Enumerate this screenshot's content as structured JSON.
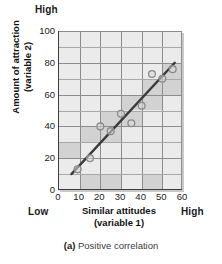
{
  "caption": {
    "marker": "(a)",
    "text": "Positive correlation"
  },
  "labels": {
    "top_high": "High",
    "bottom_low": "Low",
    "bottom_high": "High"
  },
  "chart_data": {
    "type": "scatter",
    "title": "",
    "xlabel_line1": "Similar attitudes",
    "xlabel_line2": "(variable 1)",
    "ylabel_line1": "Amount of attraction",
    "ylabel_line2": "(variable 2)",
    "xlim": [
      0,
      60
    ],
    "ylim": [
      0,
      100
    ],
    "xticks": [
      0,
      10,
      20,
      30,
      40,
      50,
      60
    ],
    "yticks": [
      0,
      20,
      40,
      60,
      80,
      100
    ],
    "grid": true,
    "legend": "none",
    "points": [
      {
        "x": 9,
        "y": 13
      },
      {
        "x": 15,
        "y": 20
      },
      {
        "x": 20,
        "y": 40
      },
      {
        "x": 25,
        "y": 37
      },
      {
        "x": 30,
        "y": 48
      },
      {
        "x": 35,
        "y": 42
      },
      {
        "x": 40,
        "y": 53
      },
      {
        "x": 45,
        "y": 73
      },
      {
        "x": 50,
        "y": 70
      },
      {
        "x": 55,
        "y": 76
      }
    ],
    "trendline": {
      "x1": 6,
      "y1": 10,
      "x2": 56,
      "y2": 80
    },
    "colors": {
      "marker_stroke": "#8a8a8a",
      "marker_fill": "#d8d8d8",
      "trendline": "#3a3a3a",
      "plot_background": "#ebebeb",
      "plot_shade": "#d2d2d2",
      "gridline": "#a8a8a8",
      "axis": "#3d3d3d"
    }
  }
}
